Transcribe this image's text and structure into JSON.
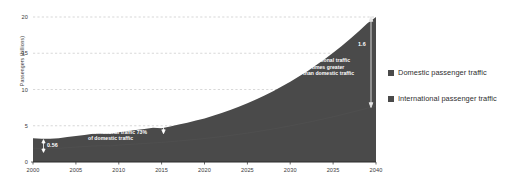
{
  "chart_data": {
    "type": "area",
    "title": "",
    "xlabel": "",
    "ylabel": "Passengers (billions)",
    "xlim": [
      2000,
      2040
    ],
    "ylim": [
      0,
      21
    ],
    "grid": true,
    "legend_position": "right",
    "x_ticks": [
      "2000",
      "2005",
      "2010",
      "2015",
      "2020",
      "2025",
      "2030",
      "2035",
      "2040"
    ],
    "y_ticks": [
      "0",
      "5",
      "10",
      "15",
      "20"
    ],
    "x": [
      2000,
      2001,
      2002,
      2003,
      2004,
      2005,
      2006,
      2007,
      2008,
      2009,
      2010,
      2011,
      2012,
      2013,
      2014,
      2015,
      2016,
      2017,
      2018,
      2019,
      2020,
      2021,
      2022,
      2023,
      2024,
      2025,
      2026,
      2027,
      2028,
      2029,
      2030,
      2031,
      2032,
      2033,
      2034,
      2035,
      2036,
      2037,
      2038,
      2039,
      2040
    ],
    "series": [
      {
        "name": "Domestic passenger traffic",
        "color": "#4a4a4a",
        "values": [
          1.9,
          1.86,
          1.84,
          1.88,
          1.98,
          2.06,
          2.13,
          2.21,
          2.24,
          2.22,
          2.33,
          2.41,
          2.48,
          2.55,
          2.63,
          2.7,
          2.8,
          2.9,
          3.01,
          3.12,
          3.24,
          3.37,
          3.51,
          3.66,
          3.82,
          3.99,
          4.17,
          4.36,
          4.56,
          4.77,
          4.99,
          5.22,
          5.46,
          5.71,
          5.97,
          6.24,
          6.52,
          6.81,
          7.11,
          7.42,
          7.7
        ]
      },
      {
        "name": "International passenger traffic",
        "color": "#4a4a4a",
        "values": [
          1.39,
          1.36,
          1.35,
          1.38,
          1.46,
          1.53,
          1.6,
          1.67,
          1.7,
          1.69,
          1.79,
          1.87,
          1.94,
          2.01,
          2.09,
          1.97,
          2.11,
          2.26,
          2.42,
          2.59,
          2.77,
          3.0,
          3.25,
          3.52,
          3.81,
          4.12,
          4.46,
          4.82,
          5.21,
          5.63,
          6.08,
          6.56,
          7.07,
          7.62,
          8.21,
          8.83,
          9.49,
          10.19,
          10.93,
          11.71,
          12.3
        ]
      }
    ],
    "totals": [
      3.29,
      3.22,
      3.19,
      3.26,
      3.44,
      3.59,
      3.73,
      3.88,
      3.94,
      3.91,
      4.12,
      4.28,
      4.42,
      4.56,
      4.72,
      4.67,
      4.91,
      5.16,
      5.43,
      5.71,
      6.01,
      6.37,
      6.76,
      7.18,
      7.63,
      8.11,
      8.63,
      9.18,
      9.77,
      10.4,
      11.07,
      11.78,
      12.53,
      13.33,
      14.18,
      15.07,
      16.01,
      17.0,
      18.04,
      19.13,
      20.0
    ],
    "annotations": [
      {
        "name": "value-2000",
        "value": "0.56",
        "at_year": 2000,
        "arrow": "double-vertical"
      },
      {
        "name": "note-2015",
        "text_line1": "International traffic 73%",
        "text_line2": "of domestic traffic",
        "at_year": 2015
      },
      {
        "name": "value-2015",
        "value": "0.73",
        "at_year": 2015,
        "arrow": "double-vertical"
      },
      {
        "name": "note-2040",
        "text_line1": "International traffic",
        "text_line2": "1.6  times greater",
        "text_line3": "than domestic traffic",
        "at_year": 2040
      },
      {
        "name": "value-2040",
        "value": "1.6",
        "at_year": 2040,
        "arrow": "double-vertical"
      }
    ]
  },
  "legend": {
    "items": [
      {
        "label": "Domestic passenger traffic",
        "color": "#4a4a4a"
      },
      {
        "label": "International passenger traffic",
        "color": "#4a4a4a"
      }
    ]
  },
  "colors": {
    "area_fill": "#4a4a4a",
    "gridline": "#bdbdbd",
    "axis": "#2b2b2b",
    "annotation_text": "#ffffff",
    "tick_text": "#3a3a3a"
  }
}
